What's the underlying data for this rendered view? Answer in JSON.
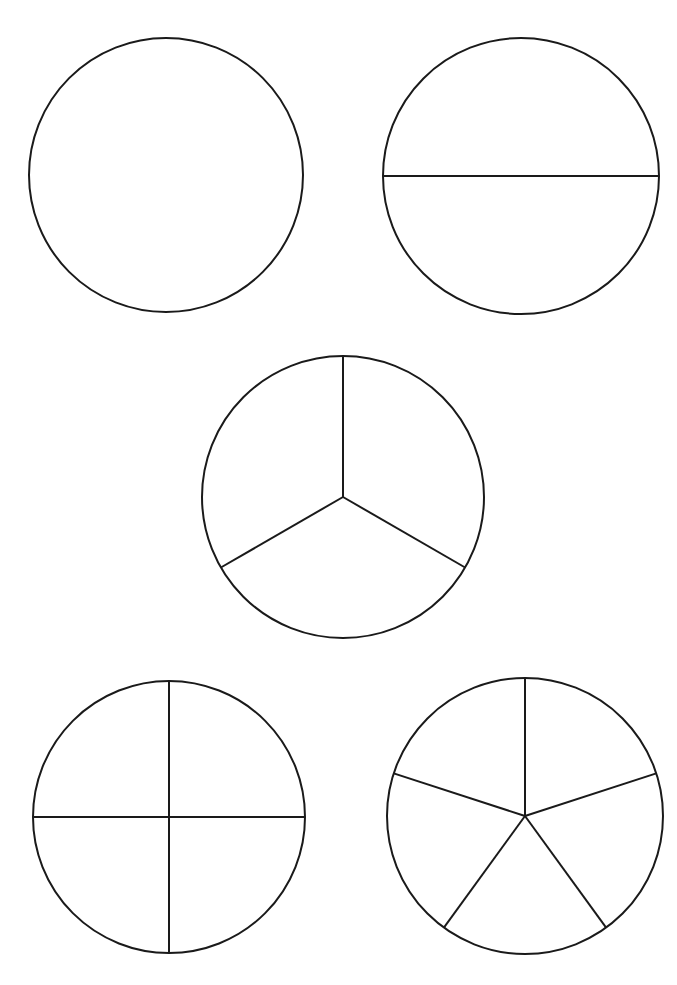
{
  "page": {
    "width": 677,
    "height": 985,
    "background_color": "#ffffff",
    "ink_color": "#1a1a1a",
    "stroke_width": 2
  },
  "chart_data": {
    "type": "pie",
    "xlabel": "",
    "ylabel": "",
    "grid": false,
    "legend": "none",
    "figures": [
      {
        "id": "circle-1",
        "name": "whole",
        "label": "1 whole",
        "parts": 1,
        "fraction_per_part": "1/1",
        "center_x": 166,
        "center_y": 175,
        "radius": 137,
        "start_angle_deg": 90,
        "divider_angles_deg": [],
        "values": [
          100
        ],
        "categories": [
          "1/1"
        ],
        "shaded": []
      },
      {
        "id": "circle-2",
        "name": "halves",
        "label": "halves",
        "parts": 2,
        "fraction_per_part": "1/2",
        "center_x": 521,
        "center_y": 176,
        "radius": 138,
        "start_angle_deg": 0,
        "divider_angles_deg": [
          0,
          180
        ],
        "values": [
          50,
          50
        ],
        "categories": [
          "1/2",
          "1/2"
        ],
        "shaded": []
      },
      {
        "id": "circle-3",
        "name": "thirds",
        "label": "thirds",
        "parts": 3,
        "fraction_per_part": "1/3",
        "center_x": 343,
        "center_y": 497,
        "radius": 141,
        "start_angle_deg": 90,
        "divider_angles_deg": [
          90,
          210,
          330
        ],
        "values": [
          33.33,
          33.33,
          33.33
        ],
        "categories": [
          "1/3",
          "1/3",
          "1/3"
        ],
        "shaded": []
      },
      {
        "id": "circle-4",
        "name": "quarters",
        "label": "quarters",
        "parts": 4,
        "fraction_per_part": "1/4",
        "center_x": 169,
        "center_y": 817,
        "radius": 136,
        "start_angle_deg": 90,
        "divider_angles_deg": [
          0,
          90,
          180,
          270
        ],
        "values": [
          25,
          25,
          25,
          25
        ],
        "categories": [
          "1/4",
          "1/4",
          "1/4",
          "1/4"
        ],
        "shaded": []
      },
      {
        "id": "circle-5",
        "name": "fifths",
        "label": "fifths",
        "parts": 5,
        "fraction_per_part": "1/5",
        "center_x": 525,
        "center_y": 816,
        "radius": 138,
        "start_angle_deg": 90,
        "divider_angles_deg": [
          90,
          162,
          234,
          306,
          18
        ],
        "values": [
          20,
          20,
          20,
          20,
          20
        ],
        "categories": [
          "1/5",
          "1/5",
          "1/5",
          "1/5",
          "1/5"
        ],
        "shaded": []
      }
    ]
  }
}
